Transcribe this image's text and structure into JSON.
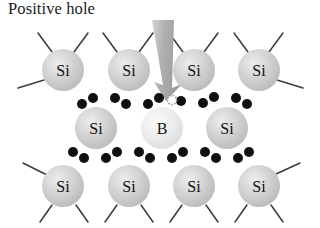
{
  "figure": {
    "title": "Positive hole",
    "background_color": "#ffffff",
    "description_type": "semiconductor-lattice-diagram"
  },
  "annotation": {
    "label": "Positive hole",
    "arrow": {
      "name": "positive-hole-arrow",
      "color": "#a8a8a8",
      "direction": "down",
      "tail_x": 163,
      "tail_y": 22,
      "tip_x": 166,
      "tip_y": 101
    },
    "hole": {
      "name": "positive-hole-marker",
      "cx": 172,
      "cy": 100,
      "r": 4.6,
      "fill": "#ffffff",
      "stroke": "#9a9a9a",
      "style": "dotted-outline"
    }
  },
  "palette": {
    "silicon_fill": "#c9c9c9",
    "silicon_fill_light": "#e2e2e2",
    "boron_fill": "#e8e8e8",
    "boron_fill_light": "#f6f6f6",
    "electron_fill": "#101010",
    "bond_stroke": "#3a3a3a",
    "label_color": "#111111",
    "arrow_color": "#a8a8a8"
  },
  "atoms": [
    {
      "id": "si-top-1",
      "label": "Si",
      "element": "Si",
      "cx": 63,
      "cy": 70,
      "r": 21
    },
    {
      "id": "si-top-2",
      "label": "Si",
      "element": "Si",
      "cx": 129,
      "cy": 70,
      "r": 21
    },
    {
      "id": "si-top-3",
      "label": "Si",
      "element": "Si",
      "cx": 194,
      "cy": 70,
      "r": 21
    },
    {
      "id": "si-top-4",
      "label": "Si",
      "element": "Si",
      "cx": 259,
      "cy": 70,
      "r": 21
    },
    {
      "id": "si-mid-1",
      "label": "Si",
      "element": "Si",
      "cx": 96,
      "cy": 128,
      "r": 21
    },
    {
      "id": "b-mid-2",
      "label": "B",
      "element": "B",
      "cx": 162,
      "cy": 128,
      "r": 21
    },
    {
      "id": "si-mid-3",
      "label": "Si",
      "element": "Si",
      "cx": 227,
      "cy": 128,
      "r": 21
    },
    {
      "id": "si-bot-1",
      "label": "Si",
      "element": "Si",
      "cx": 63,
      "cy": 186,
      "r": 21
    },
    {
      "id": "si-bot-2",
      "label": "Si",
      "element": "Si",
      "cx": 129,
      "cy": 186,
      "r": 21
    },
    {
      "id": "si-bot-3",
      "label": "Si",
      "element": "Si",
      "cx": 194,
      "cy": 186,
      "r": 21
    },
    {
      "id": "si-bot-4",
      "label": "Si",
      "element": "Si",
      "cx": 259,
      "cy": 186,
      "r": 21
    }
  ],
  "bonds": [
    {
      "id": "bond-top-1",
      "x1": 38,
      "y1": 33,
      "x2": 52,
      "y2": 52
    },
    {
      "id": "bond-top-2",
      "x1": 88,
      "y1": 33,
      "x2": 74,
      "y2": 52
    },
    {
      "id": "bond-top-3",
      "x1": 103,
      "y1": 33,
      "x2": 117,
      "y2": 52
    },
    {
      "id": "bond-top-4",
      "x1": 153,
      "y1": 33,
      "x2": 139,
      "y2": 52
    },
    {
      "id": "bond-top-5",
      "x1": 169,
      "y1": 33,
      "x2": 183,
      "y2": 52
    },
    {
      "id": "bond-top-6",
      "x1": 218,
      "y1": 33,
      "x2": 204,
      "y2": 52
    },
    {
      "id": "bond-top-7",
      "x1": 234,
      "y1": 33,
      "x2": 248,
      "y2": 52
    },
    {
      "id": "bond-top-8",
      "x1": 283,
      "y1": 33,
      "x2": 269,
      "y2": 52
    },
    {
      "id": "bond-left-top",
      "x1": 18,
      "y1": 88,
      "x2": 44,
      "y2": 80
    },
    {
      "id": "bond-left-mid",
      "x1": 23,
      "y1": 163,
      "x2": 47,
      "y2": 175
    },
    {
      "id": "bond-right-mid",
      "x1": 277,
      "y1": 80,
      "x2": 303,
      "y2": 88
    },
    {
      "id": "bond-right-bot",
      "x1": 276,
      "y1": 174,
      "x2": 300,
      "y2": 163
    },
    {
      "id": "bond-bot-1",
      "x1": 52,
      "y1": 205,
      "x2": 40,
      "y2": 222
    },
    {
      "id": "bond-bot-2",
      "x1": 76,
      "y1": 205,
      "x2": 88,
      "y2": 222
    },
    {
      "id": "bond-bot-3",
      "x1": 117,
      "y1": 205,
      "x2": 105,
      "y2": 222
    },
    {
      "id": "bond-bot-4",
      "x1": 141,
      "y1": 205,
      "x2": 153,
      "y2": 222
    },
    {
      "id": "bond-bot-5",
      "x1": 182,
      "y1": 205,
      "x2": 170,
      "y2": 222
    },
    {
      "id": "bond-bot-6",
      "x1": 206,
      "y1": 205,
      "x2": 218,
      "y2": 222
    },
    {
      "id": "bond-bot-7",
      "x1": 247,
      "y1": 205,
      "x2": 235,
      "y2": 222
    },
    {
      "id": "bond-bot-8",
      "x1": 271,
      "y1": 205,
      "x2": 283,
      "y2": 222
    }
  ],
  "electrons": {
    "radius": 5.0,
    "upper_row": [
      {
        "id": "e-u-1",
        "cx": 82,
        "cy": 104
      },
      {
        "id": "e-u-2",
        "cx": 93,
        "cy": 98
      },
      {
        "id": "e-u-3",
        "cx": 115,
        "cy": 98
      },
      {
        "id": "e-u-4",
        "cx": 126,
        "cy": 104
      },
      {
        "id": "e-u-5",
        "cx": 148,
        "cy": 104
      },
      {
        "id": "e-u-6",
        "cx": 159,
        "cy": 98
      },
      {
        "id": "e-u-7",
        "cx": 181,
        "cy": 101
      },
      {
        "id": "e-u-8",
        "cx": 203,
        "cy": 103
      },
      {
        "id": "e-u-9",
        "cx": 214,
        "cy": 97
      },
      {
        "id": "e-u-10",
        "cx": 236,
        "cy": 98
      },
      {
        "id": "e-u-11",
        "cx": 247,
        "cy": 104
      }
    ],
    "lower_row": [
      {
        "id": "e-l-1",
        "cx": 73,
        "cy": 152
      },
      {
        "id": "e-l-2",
        "cx": 84,
        "cy": 158
      },
      {
        "id": "e-l-3",
        "cx": 106,
        "cy": 158
      },
      {
        "id": "e-l-4",
        "cx": 117,
        "cy": 152
      },
      {
        "id": "e-l-5",
        "cx": 139,
        "cy": 152
      },
      {
        "id": "e-l-6",
        "cx": 150,
        "cy": 158
      },
      {
        "id": "e-l-7",
        "cx": 172,
        "cy": 158
      },
      {
        "id": "e-l-8",
        "cx": 183,
        "cy": 152
      },
      {
        "id": "e-l-9",
        "cx": 205,
        "cy": 152
      },
      {
        "id": "e-l-10",
        "cx": 216,
        "cy": 158
      },
      {
        "id": "e-l-11",
        "cx": 238,
        "cy": 158
      },
      {
        "id": "e-l-12",
        "cx": 249,
        "cy": 152
      }
    ]
  }
}
